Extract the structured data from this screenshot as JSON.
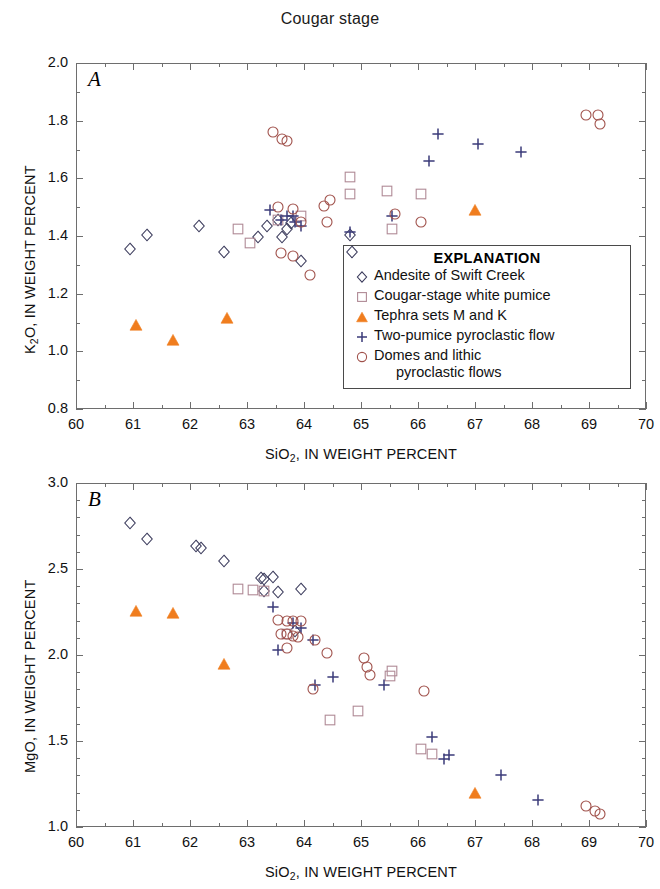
{
  "figure": {
    "title": "Cougar stage",
    "xlabel_html": "SiO<sub>2</sub>, IN WEIGHT PERCENT"
  },
  "legend": {
    "title": "EXPLANATION",
    "entries": [
      {
        "symbol": "diamond-open-marker",
        "label": "Andesite of Swift Creek",
        "color": "#3b3b5c"
      },
      {
        "symbol": "square-open-marker",
        "label": "Cougar-stage white pumice",
        "color": "#b08a96"
      },
      {
        "symbol": "triangle-filled-marker",
        "label": "Tephra sets M and K",
        "color": "#f07d1e"
      },
      {
        "symbol": "plus-marker",
        "label": "Two-pumice pyroclastic flow",
        "color": "#3b3b7a"
      },
      {
        "symbol": "circle-open-marker",
        "label": "Domes and lithic",
        "label2": "pyroclastic flows",
        "color": "#a0514b"
      }
    ]
  },
  "panelA": {
    "letter": "A",
    "ylabel_html": "K<sub>2</sub>O, IN WEIGHT PERCENT",
    "xticklabels": [
      "60",
      "61",
      "62",
      "63",
      "64",
      "65",
      "66",
      "67",
      "68",
      "69",
      "70"
    ],
    "yticklabels": [
      "0.8",
      "1.0",
      "1.2",
      "1.4",
      "1.6",
      "1.8",
      "2.0"
    ]
  },
  "panelB": {
    "letter": "B",
    "ylabel_html": "MgO, IN WEIGHT PERCENT",
    "xticklabels": [
      "60",
      "61",
      "62",
      "63",
      "64",
      "65",
      "66",
      "67",
      "68",
      "69",
      "70"
    ],
    "yticklabels": [
      "1.0",
      "1.5",
      "2.0",
      "2.5",
      "3.0"
    ]
  },
  "chart_data": [
    {
      "type": "scatter",
      "id": "panel-A",
      "title": "Cougar stage",
      "panel_label": "A",
      "xlabel": "SiO2, IN WEIGHT PERCENT",
      "ylabel": "K2O, IN WEIGHT PERCENT",
      "xlim": [
        60,
        70
      ],
      "ylim": [
        0.8,
        2.0
      ],
      "xticks": [
        60,
        61,
        62,
        63,
        64,
        65,
        66,
        67,
        68,
        69,
        70
      ],
      "yticks": [
        0.8,
        1.0,
        1.2,
        1.4,
        1.6,
        1.8,
        2.0
      ],
      "minor_xtick_step": 0.5,
      "minor_ytick_step": 0.1,
      "grid": false,
      "legend_position": "inside-lower-right",
      "series": [
        {
          "name": "Andesite of Swift Creek",
          "marker": "diamond-open",
          "color": "#3b3b5c",
          "points": [
            [
              60.95,
              1.355
            ],
            [
              61.25,
              1.405
            ],
            [
              62.15,
              1.435
            ],
            [
              62.6,
              1.345
            ],
            [
              63.2,
              1.395
            ],
            [
              63.35,
              1.435
            ],
            [
              63.55,
              1.455
            ],
            [
              63.62,
              1.395
            ],
            [
              63.7,
              1.425
            ],
            [
              63.78,
              1.445
            ],
            [
              63.95,
              1.315
            ],
            [
              64.8,
              1.405
            ],
            [
              64.85,
              1.345
            ]
          ]
        },
        {
          "name": "Cougar-stage white pumice",
          "marker": "square-open",
          "color": "#b08a96",
          "points": [
            [
              62.85,
              1.425
            ],
            [
              63.05,
              1.375
            ],
            [
              63.55,
              1.455
            ],
            [
              63.95,
              1.47
            ],
            [
              64.8,
              1.605
            ],
            [
              64.8,
              1.545
            ],
            [
              65.45,
              1.555
            ],
            [
              65.55,
              1.425
            ],
            [
              66.05,
              1.545
            ]
          ]
        },
        {
          "name": "Tephra sets M and K",
          "marker": "triangle-filled",
          "color": "#f07d1e",
          "points": [
            [
              61.05,
              1.09
            ],
            [
              61.7,
              1.04
            ],
            [
              62.65,
              1.115
            ],
            [
              67.0,
              1.49
            ]
          ]
        },
        {
          "name": "Two-pumice pyroclastic flow",
          "marker": "plus",
          "color": "#3b3b7a",
          "points": [
            [
              63.4,
              1.49
            ],
            [
              63.6,
              1.455
            ],
            [
              63.7,
              1.47
            ],
            [
              63.8,
              1.47
            ],
            [
              63.85,
              1.45
            ],
            [
              63.95,
              1.435
            ],
            [
              64.8,
              1.415
            ],
            [
              65.55,
              1.47
            ],
            [
              66.2,
              1.66
            ],
            [
              66.35,
              1.755
            ],
            [
              67.05,
              1.72
            ],
            [
              67.8,
              1.69
            ]
          ]
        },
        {
          "name": "Domes and lithic pyroclastic flows",
          "marker": "circle-open",
          "color": "#a0514b",
          "points": [
            [
              63.45,
              1.76
            ],
            [
              63.62,
              1.735
            ],
            [
              63.7,
              1.73
            ],
            [
              63.55,
              1.5
            ],
            [
              63.8,
              1.495
            ],
            [
              63.95,
              1.45
            ],
            [
              63.6,
              1.34
            ],
            [
              63.8,
              1.33
            ],
            [
              64.1,
              1.265
            ],
            [
              64.35,
              1.505
            ],
            [
              64.4,
              1.45
            ],
            [
              64.45,
              1.525
            ],
            [
              65.6,
              1.475
            ],
            [
              66.05,
              1.45
            ],
            [
              68.95,
              1.82
            ],
            [
              69.15,
              1.82
            ],
            [
              69.2,
              1.79
            ]
          ]
        }
      ]
    },
    {
      "type": "scatter",
      "id": "panel-B",
      "panel_label": "B",
      "xlabel": "SiO2, IN WEIGHT PERCENT",
      "ylabel": "MgO, IN WEIGHT PERCENT",
      "xlim": [
        60,
        70
      ],
      "ylim": [
        1.0,
        3.0
      ],
      "xticks": [
        60,
        61,
        62,
        63,
        64,
        65,
        66,
        67,
        68,
        69,
        70
      ],
      "yticks": [
        1.0,
        1.5,
        2.0,
        2.5,
        3.0
      ],
      "minor_xtick_step": 0.5,
      "minor_ytick_step": 0.1,
      "grid": false,
      "legend_position": "none",
      "series": [
        {
          "name": "Andesite of Swift Creek",
          "marker": "diamond-open",
          "color": "#3b3b5c",
          "points": [
            [
              60.95,
              2.765
            ],
            [
              61.25,
              2.675
            ],
            [
              62.1,
              2.635
            ],
            [
              62.2,
              2.625
            ],
            [
              62.6,
              2.545
            ],
            [
              63.25,
              2.45
            ],
            [
              63.3,
              2.44
            ],
            [
              63.45,
              2.455
            ],
            [
              63.55,
              2.365
            ],
            [
              63.95,
              2.385
            ],
            [
              63.3,
              2.37
            ],
            [
              63.85,
              2.14
            ]
          ]
        },
        {
          "name": "Cougar-stage white pumice",
          "marker": "square-open",
          "color": "#b08a96",
          "points": [
            [
              62.85,
              2.385
            ],
            [
              63.1,
              2.38
            ],
            [
              63.3,
              2.37
            ],
            [
              63.7,
              2.12
            ],
            [
              64.45,
              1.625
            ],
            [
              64.95,
              1.675
            ],
            [
              65.5,
              1.88
            ],
            [
              65.55,
              1.905
            ],
            [
              66.05,
              1.455
            ],
            [
              66.25,
              1.425
            ]
          ]
        },
        {
          "name": "Tephra sets M and K",
          "marker": "triangle-filled",
          "color": "#f07d1e",
          "points": [
            [
              61.05,
              2.255
            ],
            [
              61.7,
              2.245
            ],
            [
              62.6,
              1.95
            ],
            [
              67.0,
              1.2
            ]
          ]
        },
        {
          "name": "Two-pumice pyroclastic flow",
          "marker": "plus",
          "color": "#3b3b7a",
          "points": [
            [
              63.45,
              2.28
            ],
            [
              63.55,
              2.03
            ],
            [
              63.8,
              2.185
            ],
            [
              63.95,
              2.155
            ],
            [
              64.15,
              2.09
            ],
            [
              64.2,
              1.825
            ],
            [
              64.5,
              1.87
            ],
            [
              65.4,
              1.825
            ],
            [
              66.25,
              1.525
            ],
            [
              66.45,
              1.395
            ],
            [
              66.55,
              1.42
            ],
            [
              67.45,
              1.3
            ],
            [
              68.1,
              1.155
            ]
          ]
        },
        {
          "name": "Domes and lithic pyroclastic flows",
          "marker": "circle-open",
          "color": "#a0514b",
          "points": [
            [
              63.55,
              2.205
            ],
            [
              63.7,
              2.2
            ],
            [
              63.8,
              2.2
            ],
            [
              63.95,
              2.2
            ],
            [
              63.6,
              2.125
            ],
            [
              63.7,
              2.12
            ],
            [
              63.8,
              2.11
            ],
            [
              63.9,
              2.105
            ],
            [
              63.7,
              2.04
            ],
            [
              64.2,
              2.09
            ],
            [
              64.4,
              2.01
            ],
            [
              64.15,
              1.8
            ],
            [
              65.05,
              1.985
            ],
            [
              65.1,
              1.93
            ],
            [
              65.15,
              1.885
            ],
            [
              66.1,
              1.79
            ],
            [
              68.95,
              1.125
            ],
            [
              69.1,
              1.095
            ],
            [
              69.2,
              1.075
            ]
          ]
        }
      ]
    }
  ]
}
